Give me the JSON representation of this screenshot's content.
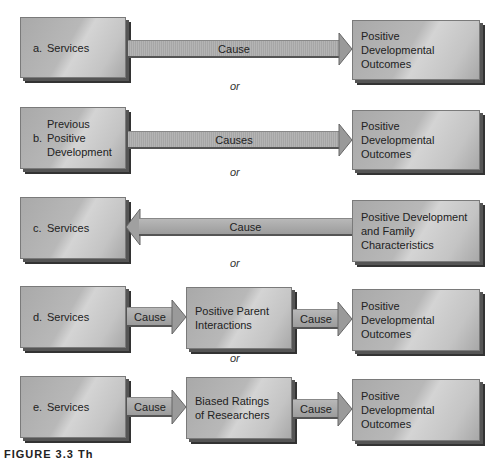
{
  "rows": [
    {
      "id": "a",
      "letter": "a.",
      "left": "Services",
      "arrow_label": "Cause",
      "right": "Positive Developmental\nOutcomes",
      "or": "or"
    },
    {
      "id": "b",
      "letter": "b.",
      "left": "Previous\nPositive\nDevelopment",
      "arrow_label": "Causes",
      "right": "Positive Developmental\nOutcomes",
      "or": "or"
    },
    {
      "id": "c",
      "letter": "c.",
      "left": "Services",
      "arrow_label": "Cause",
      "right": "Positive Development\nand Family\nCharacteristics",
      "or": "or"
    },
    {
      "id": "d",
      "letter": "d.",
      "left": "Services",
      "arrow1_label": "Cause",
      "middle": "Positive Parent\nInteractions",
      "arrow2_label": "Cause",
      "right": "Positive Developmental\nOutcomes",
      "or": "or"
    },
    {
      "id": "e",
      "letter": "e.",
      "left": "Services",
      "arrow1_label": "Cause",
      "middle": "Biased Ratings\nof Researchers",
      "arrow2_label": "Cause",
      "right": "Positive Developmental\nOutcomes"
    }
  ],
  "caption": "FIGURE 3.3  Th"
}
